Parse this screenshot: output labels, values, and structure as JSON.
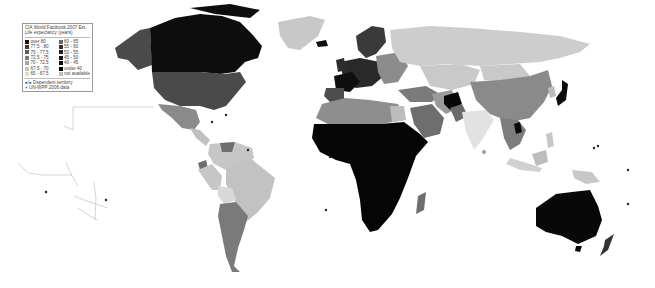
{
  "legend": {
    "title_line1": "CIA World Factbook 2007 Est.",
    "title_line2": "Life expectancy (years)",
    "left_column": [
      {
        "label": "over 80",
        "color": "#111111"
      },
      {
        "label": "77.5 - 80",
        "color": "#3a3a3a"
      },
      {
        "label": "75 - 77.5",
        "color": "#5e5e5e"
      },
      {
        "label": "72.5 - 75",
        "color": "#7c7c7c"
      },
      {
        "label": "70 - 72.5",
        "color": "#a6a6a6"
      },
      {
        "label": "67.5 - 70",
        "color": "#c4c4c4"
      },
      {
        "label": "65 - 67.5",
        "color": "#dcdcdc"
      }
    ],
    "right_column": [
      {
        "label": "60 - 65",
        "color": "#6a6a6a"
      },
      {
        "label": "55 - 60",
        "color": "#2e2e2e"
      },
      {
        "label": "50 - 55",
        "color": "#1e1e1e"
      },
      {
        "label": "45 - 50",
        "color": "#151515"
      },
      {
        "label": "40 - 45",
        "color": "#0c0c0c"
      },
      {
        "label": "under 40",
        "color": "#000000"
      },
      {
        "label": "not available",
        "color": "#bdbdbd"
      }
    ],
    "footnote_dependent": "●/● Dependent territory",
    "footnote_unwpp": "+ UN-WPP 2006 data"
  },
  "map": {
    "title": "World life expectancy map",
    "region_colors": {
      "canada": "#0d0d0d",
      "usa": "#4a4a4a",
      "alaska": "#4a4a4a",
      "greenland": "#c8c8c8",
      "mexico": "#8a8a8a",
      "central_america": "#c0c0c0",
      "south_america_north": "#c6c6c6",
      "brazil": "#c2c2c2",
      "argentina_chile": "#7a7a7a",
      "bolivia": "#d8d8d8",
      "western_europe": "#2a2a2a",
      "france": "#0f0f0f",
      "scandinavia": "#3a3a3a",
      "eastern_europe": "#8c8c8c",
      "russia": "#cdcdcd",
      "north_africa": "#8e8e8e",
      "sub_saharan_africa": "#050505",
      "madagascar": "#6e6e6e",
      "middle_east": "#7a7a7a",
      "arabia": "#6e6e6e",
      "central_asia": "#c9c9c9",
      "afghanistan": "#080808",
      "pakistan": "#6a6a6a",
      "india": "#e2e2e2",
      "china": "#8a8a8a",
      "mongolia": "#c9c9c9",
      "japan": "#0b0b0b",
      "southeast_asia": "#7c7c7c",
      "indonesia": "#d0d0d0",
      "australia": "#080808",
      "new_zealand": "#333333"
    }
  }
}
